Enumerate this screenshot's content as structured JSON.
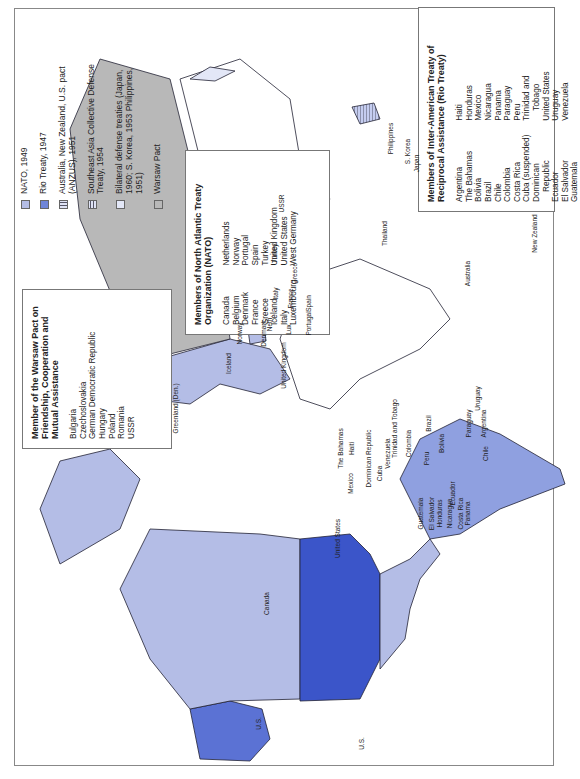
{
  "legend": {
    "items": [
      {
        "label": "NATO, 1949",
        "swatch": "nato",
        "color": "#b4bde6"
      },
      {
        "label": "Rio Treaty, 1947",
        "swatch": "rio",
        "color": "#6f85d8"
      },
      {
        "label": "Australia, New Zealand, U.S. pact (ANZUS), 1951",
        "swatch": "anzus-vertical-stripes"
      },
      {
        "label": "Southeast Asia Collective Defense Treaty, 1954",
        "swatch": "seato-horizontal-stripes"
      },
      {
        "label": "Bilateral defense treaties (Japan, 1960; S. Korea, 1953 Philippines, 1951)",
        "swatch": "bilateral",
        "color": "#e3e7f7"
      },
      {
        "label": "Warsaw Pact",
        "swatch": "warsaw",
        "color": "#b8b8b8"
      }
    ]
  },
  "warsaw_box": {
    "title": "Member of the Warsaw Pact on Friendship, Cooperation and Mutual Assistance",
    "members": [
      "Bulgaria",
      "Czechoslovakia",
      "German Democratic Republic",
      "Hungary",
      "Poland",
      "Romania",
      "USSR"
    ]
  },
  "nato_box": {
    "title": "Members of North Atlantic Treaty Organization (NATO)",
    "col1": [
      "Canada",
      "Belgium",
      "Denmark",
      "France",
      "Greece",
      "Iceland",
      "Italy",
      "Luxembourg"
    ],
    "col2": [
      "Netherlands",
      "Norway",
      "Portugal",
      "Spain",
      "Turkey",
      "United Kingdom",
      "United States",
      "West Germany"
    ]
  },
  "rio_box": {
    "title": "Members of Inter-American Treaty of Reciprocal Assistance (Rio Treaty)",
    "col1": [
      "Argentina",
      "The Bahamas",
      "Bolivia",
      "Brazil",
      "Chile",
      "Colombia",
      "Costa Rica",
      "Cuba (suspended)",
      "Dominican",
      "Republic",
      "Ecuador",
      "El Salvador",
      "Guatemala"
    ],
    "col2": [
      "Haiti",
      "Honduras",
      "Mexico",
      "Nicaragua",
      "Panama",
      "Paraguay",
      "Peru",
      "Trinidad and",
      "Tobago",
      "United States",
      "Uruguay",
      "Venezuela"
    ]
  },
  "map_labels": {
    "alaska": "U.S.",
    "hawaii": "U.S.",
    "canada": "Canada",
    "united_states": "United States",
    "greenland": "Greenland (Den.)",
    "iceland": "Iceland",
    "mexico": "Mexico",
    "cuba": "Cuba",
    "bahamas": "The Bahamas",
    "haiti": "Haiti",
    "dominican_republic": "Dominican Republic",
    "trinidad": "Trinidad and Tobago",
    "venezuela": "Venezuela",
    "colombia": "Colombia",
    "guatemala": "Guatemala",
    "el_salvador": "El Salvador",
    "honduras": "Honduras",
    "nicaragua": "Nicaragua",
    "costa_rica": "Costa Rica",
    "panama": "Panama",
    "ecuador": "Ecuador",
    "peru": "Peru",
    "brazil": "Brazil",
    "bolivia": "Bolivia",
    "paraguay": "Paraguay",
    "uruguay": "Uruguay",
    "chile": "Chile",
    "argentina": "Argentina",
    "norway": "Norway",
    "denmark": "Denmark",
    "united_kingdom": "United Kingdom",
    "neth": "Neth.",
    "lux": "Lux.",
    "portugal": "Portugal",
    "spain": "Spain",
    "france": "France",
    "italy": "Italy",
    "greece": "Greece",
    "turkey": "Turkey",
    "ussr": "USSR",
    "thailand": "Thailand",
    "philippines": "Philippines",
    "korea": "S. Korea",
    "japan": "Japan",
    "australia": "Australia",
    "new_zealand": "New Zealand"
  }
}
